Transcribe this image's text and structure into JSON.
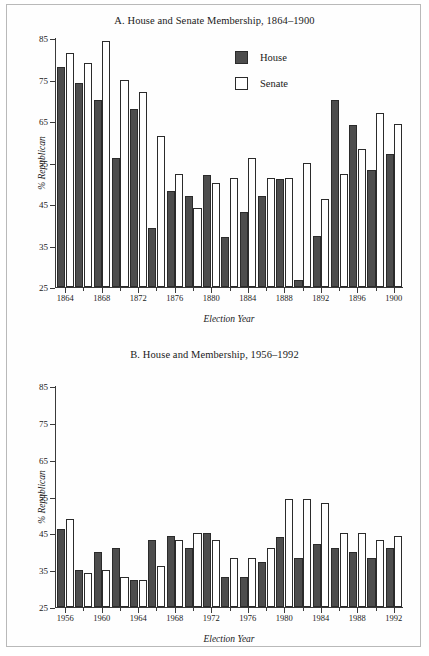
{
  "figure": {
    "panels": [
      "A",
      "B"
    ]
  },
  "legend": {
    "house_label": "House",
    "senate_label": "Senate",
    "house_color": "#4d4d4d",
    "senate_color": "#ffffff",
    "border_color": "#2b2b2b"
  },
  "chart_data": [
    {
      "type": "bar",
      "panel": "A",
      "title": "A. House and Senate Membership, 1864–1900",
      "xlabel": "Election Year",
      "ylabel": "% Republican",
      "ylim": [
        25,
        85
      ],
      "yticks": [
        25,
        35,
        45,
        55,
        65,
        75,
        85
      ],
      "grid": false,
      "legend_position": "upper-right-inside",
      "categories": [
        1864,
        1866,
        1868,
        1870,
        1872,
        1874,
        1876,
        1878,
        1880,
        1882,
        1884,
        1886,
        1888,
        1890,
        1892,
        1894,
        1896,
        1898,
        1900
      ],
      "xtick_labels": [
        "1864",
        "1868",
        "1872",
        "1876",
        "1880",
        "1884",
        "1888",
        "1892",
        "1896",
        "1900"
      ],
      "xtick_values": [
        1864,
        1868,
        1872,
        1876,
        1880,
        1884,
        1888,
        1892,
        1896,
        1900
      ],
      "series": [
        {
          "name": "House",
          "color": "#4d4d4d",
          "values": [
            78,
            74.2,
            70,
            56,
            68,
            39.2,
            48.2,
            47,
            52,
            37,
            43,
            47,
            51,
            26.8,
            37.2,
            70,
            64,
            53.2,
            57
          ]
        },
        {
          "name": "Senate",
          "color": "#ffffff",
          "values": [
            81.3,
            79,
            84.3,
            75,
            72,
            61.3,
            52.2,
            44,
            50,
            51.2,
            56,
            51.2,
            51.2,
            55,
            46.2,
            52.2,
            58.2,
            67,
            64.2
          ]
        }
      ]
    },
    {
      "type": "bar",
      "panel": "B",
      "title": "B. House and Membership, 1956–1992",
      "xlabel": "Election Year",
      "ylabel": "% Republican",
      "ylim": [
        25,
        85
      ],
      "yticks": [
        25,
        35,
        45,
        55,
        65,
        75,
        85
      ],
      "grid": false,
      "legend_position": "upper-right-inside",
      "categories": [
        1956,
        1958,
        1960,
        1962,
        1964,
        1966,
        1968,
        1970,
        1972,
        1974,
        1976,
        1978,
        1980,
        1982,
        1984,
        1986,
        1988,
        1990,
        1992
      ],
      "xtick_labels": [
        "1956",
        "1960",
        "1964",
        "1968",
        "1972",
        "1976",
        "1980",
        "1984",
        "1988",
        "1992"
      ],
      "xtick_values": [
        1956,
        1960,
        1964,
        1968,
        1972,
        1976,
        1980,
        1984,
        1988,
        1992
      ],
      "series": [
        {
          "name": "House",
          "color": "#4d4d4d",
          "values": [
            46.2,
            35.1,
            40,
            41,
            32.2,
            43.2,
            44.2,
            41,
            45,
            33.1,
            33.1,
            37.2,
            44.1,
            38.2,
            42,
            41,
            40,
            38.2,
            41
          ]
        },
        {
          "name": "Senate",
          "color": "#ffffff",
          "values": [
            49,
            34.2,
            35.1,
            33.1,
            32.2,
            36.2,
            43.2,
            45,
            43.2,
            38.2,
            38.2,
            41,
            54.2,
            54.2,
            53.2,
            45,
            45,
            43.2,
            44.2
          ]
        }
      ]
    }
  ]
}
